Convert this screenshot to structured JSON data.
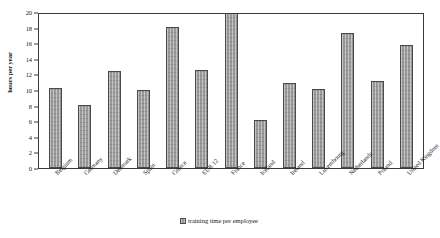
{
  "chart_data": {
    "type": "bar",
    "title": "",
    "xlabel": "",
    "ylabel": "hours per year",
    "ylim": [
      0,
      20
    ],
    "yticks": [
      0,
      2,
      4,
      6,
      8,
      10,
      12,
      14,
      16,
      18,
      20
    ],
    "grid": false,
    "legend_position": "bottom-center",
    "legend": [
      "training time per employee"
    ],
    "categories": [
      "Belgium",
      "Germany",
      "Denmark",
      "Spain",
      "Greece",
      "EUR 12",
      "France",
      "Iceland",
      "Ireland",
      "Luxembourg",
      "Netherlands",
      "Poland",
      "United Kingdom"
    ],
    "series": [
      {
        "name": "training time per employee",
        "values": [
          10.2,
          8.1,
          12.5,
          10.0,
          18.1,
          12.6,
          20.0,
          6.2,
          10.9,
          10.1,
          17.3,
          11.1,
          15.8
        ]
      }
    ]
  },
  "colors": {
    "bar_fill": "#9a9a9a",
    "bar_border": "#4a4a4a",
    "frame": "#3a3a3a",
    "background": "#ffffff",
    "text": "#1a1a1a"
  },
  "legend_item": {
    "label": "training time per employee"
  }
}
